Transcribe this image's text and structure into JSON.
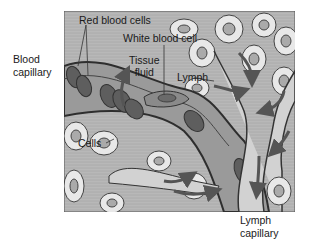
{
  "diagram": {
    "type": "anatomical-illustration",
    "colors": {
      "background": "#ffffff",
      "tissue_fluid": "#b5b5b5",
      "vessel_wall": "#3a3a3a",
      "red_blood_cell": "#5e5e5e",
      "cell_body": "#e6e6e6",
      "nucleus": "#b0b0b0",
      "lymph": "#d2d2d2",
      "arrow": "#555555"
    }
  },
  "labels": {
    "blood_capillary": [
      "Blood",
      "capillary"
    ],
    "red_blood_cells": "Red blood cells",
    "white_blood_cell": "White blood cell",
    "tissue_fluid": [
      "Tissue",
      "fluid"
    ],
    "lymph": "Lymph",
    "cells": "Cells",
    "lymph_capillary": [
      "Lymph",
      "capillary"
    ]
  }
}
